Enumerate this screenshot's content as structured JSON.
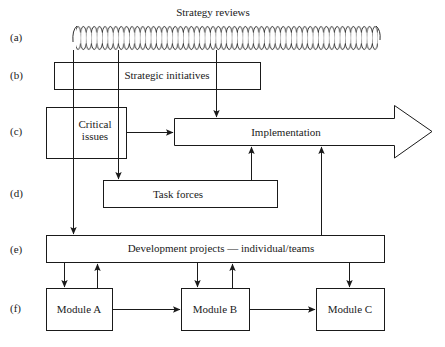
{
  "diagram": {
    "title": "Strategy reviews",
    "row_labels": [
      "(a)",
      "(b)",
      "(c)",
      "(d)",
      "(e)",
      "(f)"
    ],
    "nodes": {
      "strategy_reviews": "Strategy reviews",
      "strategic_initiatives": "Strategic initiatives",
      "critical_issues_line1": "Critical",
      "critical_issues_line2": "issues",
      "implementation": "Implementation",
      "task_forces": "Task forces",
      "development_projects": "Development projects — individual/teams",
      "module_a": "Module A",
      "module_b": "Module B",
      "module_c": "Module C"
    },
    "edges": [
      {
        "from": "strategy_reviews",
        "to": "development_projects"
      },
      {
        "from": "strategy_reviews",
        "to": "task_forces"
      },
      {
        "from": "strategy_reviews",
        "to": "implementation"
      },
      {
        "from": "critical_issues",
        "to": "implementation"
      },
      {
        "from": "task_forces",
        "to": "implementation"
      },
      {
        "from": "development_projects",
        "to": "implementation"
      },
      {
        "from": "development_projects",
        "to": "module_a"
      },
      {
        "from": "module_a",
        "to": "development_projects"
      },
      {
        "from": "development_projects",
        "to": "module_b"
      },
      {
        "from": "module_b",
        "to": "development_projects"
      },
      {
        "from": "development_projects",
        "to": "module_c"
      },
      {
        "from": "module_a",
        "to": "module_b"
      },
      {
        "from": "module_b",
        "to": "module_c"
      }
    ]
  }
}
